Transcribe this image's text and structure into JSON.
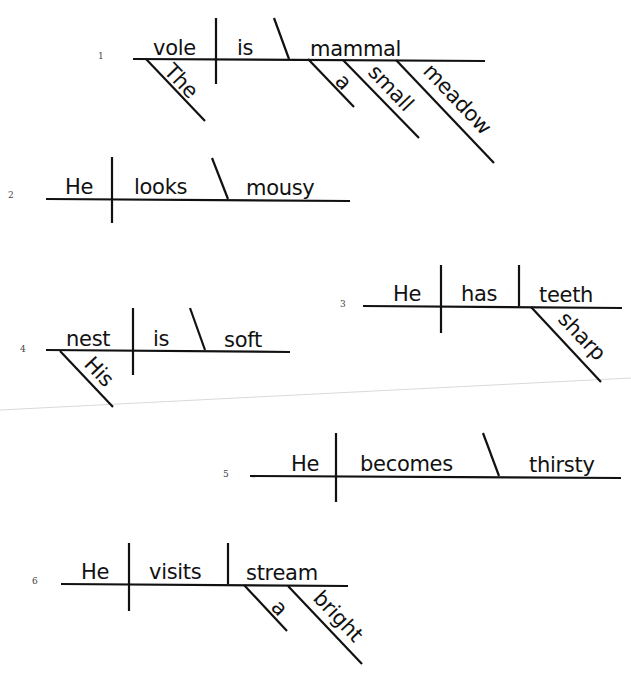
{
  "sentences": [
    {
      "number": "1",
      "subject": "vole",
      "verb": "is",
      "complement": "mammal",
      "complement_type": "predicate-nominative",
      "modifiers": {
        "subject": [
          "The"
        ],
        "complement": [
          "a",
          "small",
          "meadow"
        ]
      }
    },
    {
      "number": "2",
      "subject": "He",
      "verb": "looks",
      "complement": "mousy",
      "complement_type": "predicate-adjective",
      "modifiers": {}
    },
    {
      "number": "3",
      "subject": "He",
      "verb": "has",
      "complement": "teeth",
      "complement_type": "direct-object",
      "modifiers": {
        "complement": [
          "sharp"
        ]
      }
    },
    {
      "number": "4",
      "subject": "nest",
      "verb": "is",
      "complement": "soft",
      "complement_type": "predicate-adjective",
      "modifiers": {
        "subject": [
          "His"
        ]
      }
    },
    {
      "number": "5",
      "subject": "He",
      "verb": "becomes",
      "complement": "thirsty",
      "complement_type": "predicate-adjective",
      "modifiers": {}
    },
    {
      "number": "6",
      "subject": "He",
      "verb": "visits",
      "complement": "stream",
      "complement_type": "direct-object",
      "modifiers": {
        "complement": [
          "a",
          "bright"
        ]
      }
    }
  ]
}
